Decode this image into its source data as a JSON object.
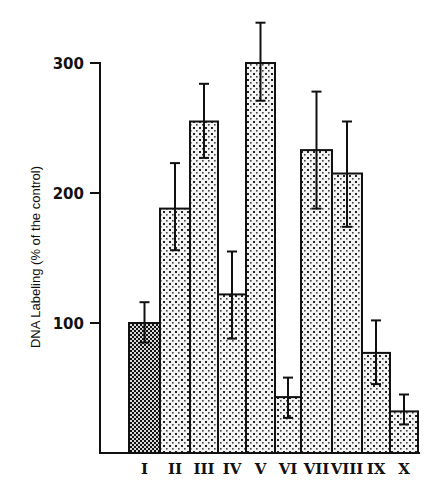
{
  "chart_data": {
    "type": "bar",
    "title": "",
    "xlabel": "",
    "ylabel": "DNA Labeling (% of  the control)",
    "categories": [
      "I",
      "II",
      "III",
      "IV",
      "V",
      "VI",
      "VII",
      "VIII",
      "IX",
      "X"
    ],
    "values": [
      100,
      188,
      255,
      122,
      300,
      43,
      233,
      215,
      77,
      32
    ],
    "error_upper": [
      116,
      223,
      284,
      155,
      331,
      58,
      278,
      255,
      102,
      45
    ],
    "error_lower": [
      85,
      156,
      227,
      88,
      271,
      27,
      188,
      174,
      53,
      22
    ],
    "yticks": [
      100,
      200,
      300
    ],
    "ytick_labels": [
      "100",
      "200",
      "300"
    ],
    "ylim": [
      0,
      300
    ],
    "grid": false,
    "legend": null,
    "bar_patterns": [
      "dense-checker",
      "dots",
      "dots",
      "dots",
      "dots",
      "dots",
      "dots",
      "dots",
      "dots",
      "dots"
    ]
  },
  "colors": {
    "ink": "#111111",
    "background": "#ffffff"
  }
}
